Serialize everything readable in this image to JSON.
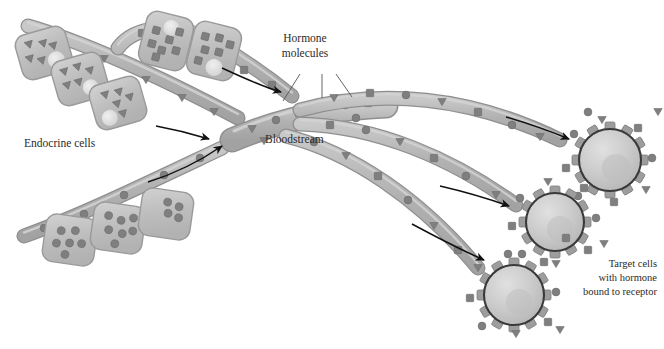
{
  "figure": {
    "title_alt": "Endocrine hormone signaling diagram",
    "type": "biological-diagram",
    "palette": {
      "background": "#ffffff",
      "vessel_fill": "#b0b0b0",
      "vessel_edge": "#8a8a8a",
      "vessel_lumen": "#c6c6c6",
      "cell_fill": "#c2c2c2",
      "cell_edge": "#9a9a9a",
      "nucleus": "#dcdcdc",
      "molecule": "#7f7f7f",
      "molecule_dark": "#6e6e6e",
      "target_cell_fill": "#c8c8c8",
      "target_cell_edge": "#3a3a3a",
      "receptor": "#9d9d9d",
      "arrow": "#111111",
      "text": "#2b2b2b",
      "leader": "#555555"
    }
  },
  "labels": {
    "endocrine_cells": "Endocrine cells",
    "hormone_molecules_line1": "Hormone",
    "hormone_molecules_line2": "molecules",
    "bloodstream": "Bloodstream",
    "target_line1": "Target cells",
    "target_line2": "with hormone",
    "target_line3": "bound to receptor"
  },
  "diagram_data": {
    "endocrine_cell_groups": [
      {
        "name": "triangle-hormone-group",
        "molecule_shape": "triangle",
        "cell_count": 3,
        "position": "upper-left",
        "cells": [
          {
            "x": 18,
            "y": 30,
            "w": 52,
            "h": 46,
            "rot": -16,
            "molecules": 5
          },
          {
            "x": 54,
            "y": 56,
            "w": 52,
            "h": 46,
            "rot": -16,
            "molecules": 5
          },
          {
            "x": 92,
            "y": 80,
            "w": 52,
            "h": 46,
            "rot": -16,
            "molecules": 5
          }
        ]
      },
      {
        "name": "square-hormone-group",
        "molecule_shape": "square",
        "cell_count": 2,
        "position": "upper-middle",
        "cells": [
          {
            "x": 142,
            "y": 12,
            "w": 48,
            "h": 54,
            "rot": 14,
            "molecules": 7
          },
          {
            "x": 190,
            "y": 22,
            "w": 48,
            "h": 54,
            "rot": 14,
            "molecules": 6
          }
        ]
      },
      {
        "name": "circle-hormone-group",
        "molecule_shape": "circle",
        "cell_count": 3,
        "position": "lower-left",
        "cells": [
          {
            "x": 44,
            "y": 216,
            "w": 52,
            "h": 48,
            "rot": 8,
            "molecules": 6
          },
          {
            "x": 92,
            "y": 204,
            "w": 52,
            "h": 48,
            "rot": 8,
            "molecules": 7
          },
          {
            "x": 140,
            "y": 190,
            "w": 52,
            "h": 48,
            "rot": 8,
            "molecules": 4
          }
        ]
      }
    ],
    "vessels": [
      {
        "name": "vessel-from-triangle-cells",
        "molecule_shape": "triangle"
      },
      {
        "name": "vessel-from-square-cells",
        "molecule_shape": "square"
      },
      {
        "name": "vessel-from-circle-cells",
        "molecule_shape": "circle"
      },
      {
        "name": "vessel-main-trunk",
        "molecule_shape": "mixed"
      },
      {
        "name": "vessel-branch-upper-right",
        "molecule_shape": "mixed"
      },
      {
        "name": "vessel-branch-middle-right",
        "molecule_shape": "mixed"
      },
      {
        "name": "vessel-branch-lower-right",
        "molecule_shape": "mixed"
      }
    ],
    "target_cells": [
      {
        "name": "target-cell-upper",
        "cx": 610,
        "cy": 160,
        "r": 31,
        "receptors": 12,
        "bound": true
      },
      {
        "name": "target-cell-middle",
        "cx": 555,
        "cy": 222,
        "r": 29,
        "receptors": 12,
        "bound": true
      },
      {
        "name": "target-cell-lower",
        "cx": 514,
        "cy": 295,
        "r": 30,
        "receptors": 12,
        "bound": true
      }
    ],
    "flow_arrows": [
      {
        "name": "arrow-square-cells-to-vessel",
        "from": [
          222,
          68
        ],
        "to": [
          283,
          93
        ]
      },
      {
        "name": "arrow-triangle-cells-to-vessel",
        "from": [
          156,
          126
        ],
        "to": [
          212,
          140
        ]
      },
      {
        "name": "arrow-circle-cells-to-trunk",
        "from": [
          148,
          182
        ],
        "to": [
          225,
          143
        ]
      },
      {
        "name": "arrow-to-upper-target",
        "from": [
          506,
          117
        ],
        "to": [
          572,
          140
        ]
      },
      {
        "name": "arrow-to-middle-target",
        "from": [
          440,
          186
        ],
        "to": [
          512,
          208
        ]
      },
      {
        "name": "arrow-to-lower-target",
        "from": [
          412,
          224
        ],
        "to": [
          487,
          262
        ]
      }
    ],
    "molecule_shapes_legend": [
      "triangle",
      "square",
      "circle"
    ]
  }
}
